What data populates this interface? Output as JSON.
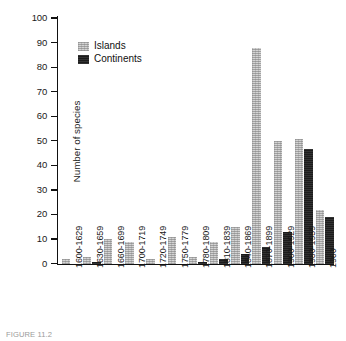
{
  "chart_data": {
    "type": "bar",
    "title": "",
    "xlabel": "",
    "ylabel": "Number of species",
    "ylim": [
      0,
      100
    ],
    "ytick_step": 10,
    "yticks": [
      0,
      10,
      20,
      30,
      40,
      50,
      60,
      70,
      80,
      90,
      100
    ],
    "grid": false,
    "legend_position": "top-left-inside",
    "categories": [
      "1600-1629",
      "1630-1659",
      "1660-1699",
      "1700-1719",
      "1720-1749",
      "1750-1779",
      "1780-1809",
      "1810-1839",
      "1840-1869",
      "1870-1899",
      "1900-1929",
      "1930-1959",
      "1960"
    ],
    "series": [
      {
        "name": "Islands",
        "color": "#d4d4d4",
        "values": [
          2,
          3,
          10,
          9,
          2,
          11,
          3,
          9,
          15,
          88,
          50,
          51,
          22
        ]
      },
      {
        "name": "Continents",
        "color": "#1c1c1c",
        "values": [
          0,
          1,
          0,
          0,
          0,
          0,
          1,
          2,
          4,
          7,
          13,
          47,
          19
        ]
      }
    ]
  },
  "legend": {
    "items": [
      {
        "label": "Islands"
      },
      {
        "label": "Continents"
      }
    ]
  },
  "caption": {
    "text": "FIGURE 11.2"
  }
}
